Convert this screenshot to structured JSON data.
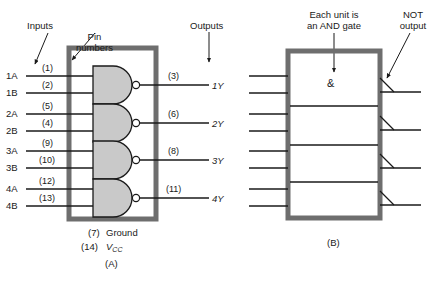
{
  "figure": {
    "panel_a_caption": "(A)",
    "panel_b_caption": "(B)"
  },
  "colors": {
    "chip_body": "#6e6e6e",
    "gate_fill": "#c9c9c9",
    "line": "#1a1a1a",
    "background": "#ffffff"
  },
  "panel_a": {
    "annotations": [
      {
        "name": "inputs-annotation",
        "text": "Inputs"
      },
      {
        "name": "pin-numbers-annotation",
        "text": "Pin\nnumbers"
      },
      {
        "name": "outputs-annotation",
        "text": "Outputs"
      }
    ],
    "inputs": [
      {
        "label": "1A",
        "pin": "(1)"
      },
      {
        "label": "1B",
        "pin": "(2)"
      },
      {
        "label": "2A",
        "pin": "(5)"
      },
      {
        "label": "2B",
        "pin": "(4)"
      },
      {
        "label": "3A",
        "pin": "(9)"
      },
      {
        "label": "3B",
        "pin": "(10)"
      },
      {
        "label": "4A",
        "pin": "(12)"
      },
      {
        "label": "4B",
        "pin": "(13)"
      }
    ],
    "outputs": [
      {
        "label": "1Y",
        "pin": "(3)"
      },
      {
        "label": "2Y",
        "pin": "(6)"
      },
      {
        "label": "3Y",
        "pin": "(8)"
      },
      {
        "label": "4Y",
        "pin": "(11)"
      }
    ],
    "power": [
      {
        "pin": "(7)",
        "name": "Ground"
      },
      {
        "pin": "(14)",
        "name": "V",
        "subscript": "CC"
      }
    ]
  },
  "panel_b": {
    "annotations": [
      {
        "name": "and-gate-annotation",
        "text": "Each unit is\nan AND gate"
      },
      {
        "name": "not-output-annotation",
        "text": "NOT\noutput"
      }
    ],
    "and_symbol": "&",
    "unit_count": 4,
    "inputs_per_unit": 2,
    "outputs_per_unit": 1
  }
}
